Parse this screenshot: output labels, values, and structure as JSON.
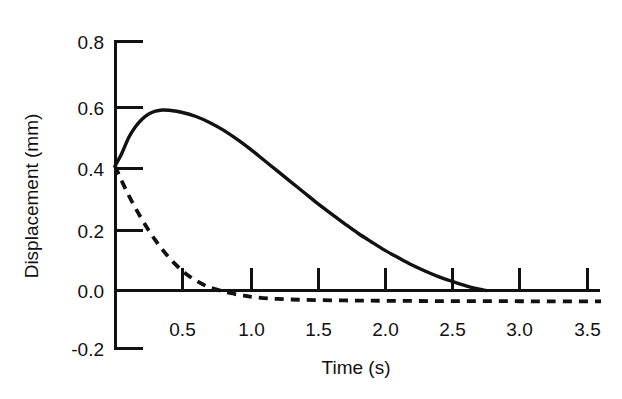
{
  "chart_data": {
    "type": "line",
    "title": "",
    "xlabel": "Time (s)",
    "ylabel": "Displacement (mm)",
    "xlim": [
      0.0,
      3.62
    ],
    "ylim": [
      -0.2,
      0.8
    ],
    "grid": false,
    "legend": "none",
    "xticks": [
      0.5,
      1.0,
      1.5,
      2.0,
      2.5,
      3.0,
      3.5
    ],
    "xticklabels": [
      "0.5",
      "1.0",
      "1.5",
      "2.0",
      "2.5",
      "3.0",
      "3.5"
    ],
    "yticks": [
      -0.2,
      0.0,
      0.2,
      0.4,
      0.6,
      0.8
    ],
    "yticklabels": [
      "-0.2",
      "0.0",
      "0.2",
      "0.4",
      "0.6",
      "0.8"
    ],
    "series": [
      {
        "name": "solid-curve",
        "style": "solid",
        "color": "#111111",
        "x": [
          0.0,
          0.05,
          0.1,
          0.15,
          0.2,
          0.25,
          0.3,
          0.35,
          0.4,
          0.5,
          0.6,
          0.7,
          0.8,
          0.9,
          1.0,
          1.1,
          1.2,
          1.3,
          1.4,
          1.5,
          1.6,
          1.7,
          1.8,
          1.9,
          2.0,
          2.1,
          2.2,
          2.3,
          2.4,
          2.5,
          2.6,
          2.7,
          2.75
        ],
        "y": [
          0.4,
          0.44,
          0.49,
          0.525,
          0.55,
          0.567,
          0.576,
          0.58,
          0.579,
          0.572,
          0.559,
          0.54,
          0.516,
          0.487,
          0.455,
          0.42,
          0.385,
          0.35,
          0.315,
          0.28,
          0.247,
          0.215,
          0.184,
          0.156,
          0.129,
          0.105,
          0.082,
          0.062,
          0.044,
          0.029,
          0.015,
          0.004,
          0.0
        ]
      },
      {
        "name": "dashed-curve",
        "style": "dashed",
        "color": "#111111",
        "x": [
          0.0,
          0.05,
          0.1,
          0.15,
          0.2,
          0.25,
          0.3,
          0.35,
          0.4,
          0.45,
          0.5,
          0.55,
          0.6,
          0.65,
          0.7,
          0.78,
          0.85,
          0.95,
          1.05,
          1.2,
          1.4,
          1.7,
          2.0,
          2.4,
          2.8,
          3.2,
          3.6
        ],
        "y": [
          0.4,
          0.352,
          0.307,
          0.266,
          0.228,
          0.193,
          0.161,
          0.132,
          0.106,
          0.083,
          0.063,
          0.046,
          0.032,
          0.02,
          0.01,
          0.0,
          -0.008,
          -0.016,
          -0.022,
          -0.027,
          -0.03,
          -0.032,
          -0.033,
          -0.034,
          -0.034,
          -0.035,
          -0.035
        ]
      }
    ]
  },
  "axes": {
    "x_axis_label": "Time (s)",
    "y_axis_label": "Displacement (mm)"
  }
}
